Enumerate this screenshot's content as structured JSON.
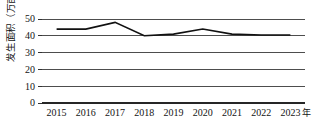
{
  "chart_data": {
    "type": "line",
    "title": "",
    "subtitle": "",
    "xlabel": "年",
    "ylabel": "发生面积（万亩）",
    "categories": [
      "2015",
      "2016",
      "2017",
      "2018",
      "2019",
      "2020",
      "2021",
      "2022",
      "2023"
    ],
    "series": [
      {
        "name": "发生面积",
        "values": [
          44,
          44,
          48,
          40,
          41,
          44,
          41,
          40.5,
          40.5
        ]
      }
    ],
    "ylim": [
      0,
      50
    ],
    "yticks": [
      0,
      10,
      20,
      30,
      40,
      50
    ],
    "ytick_labels": [
      "0",
      "10",
      "20",
      "30",
      "40",
      "50"
    ],
    "xtick_labels": [
      "2015",
      "2016",
      "2017",
      "2018",
      "2019",
      "2020",
      "2021",
      "2022",
      "2023"
    ],
    "x_unit_suffix": "年",
    "grid": true,
    "grid_axis": "y",
    "legend": false,
    "legend_position": "none",
    "line_color": "#111111",
    "grid_color": "#4d4d4d",
    "axis_color": "#262626",
    "background_color": "#ffffff",
    "markers": false
  },
  "figure": {
    "width": 312,
    "height": 126
  }
}
